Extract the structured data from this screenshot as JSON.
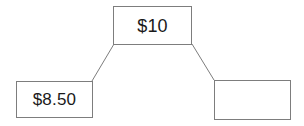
{
  "diagram": {
    "background_color": "#ffffff",
    "border_color": "#7d7d7d",
    "text_color": "#1a1a1a",
    "nodes": [
      {
        "id": "root",
        "label": "$10",
        "x": 113,
        "y": 6,
        "width": 79,
        "height": 39,
        "empty": false
      },
      {
        "id": "left-child",
        "label": "$8.50",
        "x": 16,
        "y": 81,
        "width": 77,
        "height": 37,
        "empty": false
      },
      {
        "id": "right-child",
        "label": "",
        "x": 214,
        "y": 80,
        "width": 77,
        "height": 40,
        "empty": true
      }
    ],
    "connectors": [
      {
        "id": "root-to-left",
        "from": "root",
        "to": "left-child",
        "x1": 114,
        "y1": 44,
        "x2": 92,
        "y2": 81
      },
      {
        "id": "root-to-right",
        "from": "root",
        "to": "right-child",
        "x1": 192,
        "y1": 44,
        "x2": 214,
        "y2": 80
      }
    ]
  }
}
